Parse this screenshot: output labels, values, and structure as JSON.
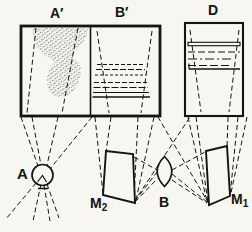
{
  "figure": {
    "colors": {
      "ink": "#141414",
      "paper": "#f7f6f1"
    },
    "labels": {
      "screen_left": "A′",
      "screen_right": "B′",
      "screen_d": "D",
      "source": "A",
      "mirror2": {
        "base": "M",
        "sub": "2"
      },
      "lens": "B",
      "mirror1": {
        "base": "M",
        "sub": "1"
      }
    }
  }
}
